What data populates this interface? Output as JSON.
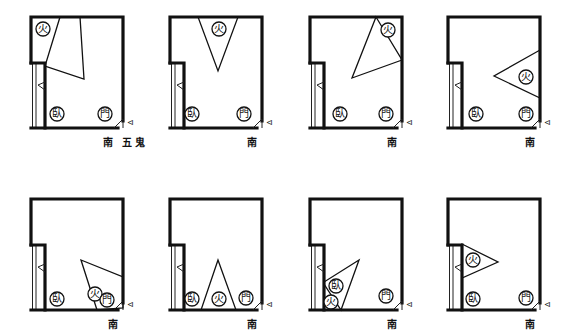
{
  "figure": {
    "type": "floor-plan-comparison",
    "panel_count": 8,
    "layout": {
      "rows": 2,
      "cols": 4
    }
  },
  "symbols": {
    "fire": "火",
    "bed": "臥",
    "door": "門",
    "door_mark": "⊲",
    "south": "南",
    "five_ghosts": "五鬼"
  },
  "panels": [
    {
      "id": 1,
      "caption": "南 五鬼",
      "fire_position": "top-left",
      "sector_direction": "from top-left corner toward center"
    },
    {
      "id": 2,
      "caption": "南",
      "fire_position": "top-center",
      "sector_direction": "from top wall downward"
    },
    {
      "id": 3,
      "caption": "南",
      "fire_position": "top-right",
      "sector_direction": "from top-right corner toward center"
    },
    {
      "id": 4,
      "caption": "南",
      "fire_position": "right-middle",
      "sector_direction": "from right wall toward center"
    },
    {
      "id": 5,
      "caption": "南",
      "fire_position": "bottom-right",
      "sector_direction": "from bottom-right toward center"
    },
    {
      "id": 6,
      "caption": "南",
      "fire_position": "bottom-center",
      "sector_direction": "from bottom wall upward"
    },
    {
      "id": 7,
      "caption": "南",
      "fire_position": "bottom-left",
      "sector_direction": "from bottom-left toward center"
    },
    {
      "id": 8,
      "caption": "南",
      "fire_position": "left-middle",
      "sector_direction": "from left wall toward center"
    }
  ]
}
